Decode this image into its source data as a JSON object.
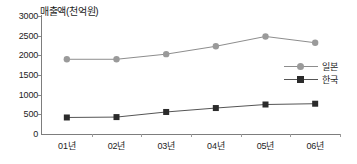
{
  "chart_data": {
    "type": "line",
    "title": "매출액(천억원)",
    "xlabel": "",
    "ylabel": "",
    "categories": [
      "01년",
      "02년",
      "03년",
      "04년",
      "05년",
      "06년"
    ],
    "series": [
      {
        "name": "일본",
        "values": [
          1900,
          1900,
          2030,
          2230,
          2480,
          2320
        ],
        "marker": "circle",
        "color": "#9a9a9a",
        "line_color": "#8d8d8d"
      },
      {
        "name": "한국",
        "values": [
          420,
          430,
          560,
          660,
          750,
          770
        ],
        "marker": "square",
        "color": "#2b2b2b",
        "line_color": "#555555"
      }
    ],
    "ylim": [
      0,
      3000
    ],
    "yticks": [
      0,
      500,
      1000,
      1500,
      2000,
      2500,
      3000
    ],
    "ytick_labels": [
      "0",
      "500",
      "1000",
      "1500",
      "2000",
      "2500",
      "3000"
    ],
    "grid": false,
    "legend_position": "right-middle"
  },
  "legend": {
    "entries": [
      {
        "label": "일본"
      },
      {
        "label": "한국"
      }
    ]
  },
  "axis_colors": {
    "axis_line": "#7d7d7d",
    "text": "#1c1c1c"
  }
}
